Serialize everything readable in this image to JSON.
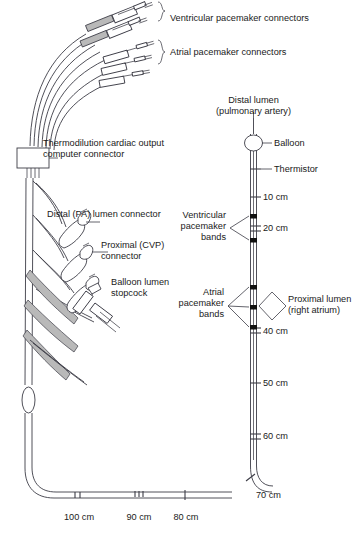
{
  "figure": {
    "line_color": "#3c3c46",
    "band_color": "#111111",
    "shade_color": "#b9b9b9",
    "text_color": "#1a1a1a",
    "background": "#ffffff"
  },
  "labels": {
    "ventricular_connectors": "Ventricular pacemaker connectors",
    "atrial_connectors": "Atrial pacemaker connectors",
    "distal_lumen_line1": "Distal lumen",
    "distal_lumen_line2": "(pulmonary artery)",
    "thermodilution_line1": "Thermodilution cardiac output",
    "thermodilution_line2": "computer connector",
    "balloon": "Balloon",
    "thermistor": "Thermistor",
    "distal_pa_connector": "Distal (PA) lumen connector",
    "proximal_cvp_line1": "Proximal (CVP)",
    "proximal_cvp_line2": "connector",
    "balloon_stopcock_line1": "Balloon lumen",
    "balloon_stopcock_line2": "stopcock",
    "ventricular_bands_line1": "Ventricular",
    "ventricular_bands_line2": "pacemaker",
    "ventricular_bands_line3": "bands",
    "atrial_bands_line1": "Atrial",
    "atrial_bands_line2": "pacemaker",
    "atrial_bands_line3": "bands",
    "proximal_lumen_line1": "Proximal lumen",
    "proximal_lumen_line2": "(right atrium)"
  },
  "depth_markers": {
    "shaft_vertical": [
      {
        "value": "10 cm",
        "ticks": 1,
        "y": 197
      },
      {
        "value": "20 cm",
        "ticks": 2,
        "y": 229
      },
      {
        "value": "40 cm",
        "ticks": 2,
        "y": 331
      },
      {
        "value": "50 cm",
        "ticks": 1,
        "y": 383
      },
      {
        "value": "60 cm",
        "ticks": 2,
        "y": 437
      },
      {
        "value": "70 cm",
        "ticks": 1,
        "y": 494
      }
    ],
    "shaft_horizontal": [
      {
        "value": "80 cm",
        "ticks": 1,
        "x": 185
      },
      {
        "value": "90 cm",
        "ticks": 3,
        "x": 139
      },
      {
        "value": "100 cm",
        "ticks": 2,
        "x": 78
      }
    ]
  },
  "components": {
    "ventricular_connector_count": 2,
    "atrial_connector_count": 3,
    "ventricular_band_count": 2,
    "atrial_band_count": 3,
    "lumen_connector_count": 3
  }
}
